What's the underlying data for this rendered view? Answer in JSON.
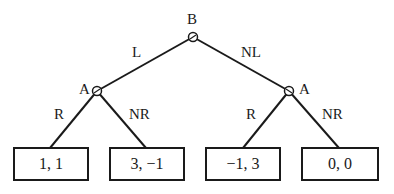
{
  "diagram": {
    "type": "game-tree",
    "root": {
      "player": "B",
      "actions": [
        {
          "label": "L",
          "node": {
            "player": "A",
            "actions": [
              {
                "label": "R",
                "payoff": "1, 1"
              },
              {
                "label": "NR",
                "payoff": "3, −1"
              }
            ]
          }
        },
        {
          "label": "NL",
          "node": {
            "player": "A",
            "actions": [
              {
                "label": "R",
                "payoff": "−1, 3"
              },
              {
                "label": "NR",
                "payoff": "0, 0"
              }
            ]
          }
        }
      ]
    }
  },
  "labels": {
    "root_player": "B",
    "left_player": "A",
    "right_player": "A",
    "edge_L": "L",
    "edge_NL": "NL",
    "edge_left_R": "R",
    "edge_left_NR": "NR",
    "edge_right_R": "R",
    "edge_right_NR": "NR"
  },
  "payoffs": [
    "1, 1",
    "3, −1",
    "−1, 3",
    "0, 0"
  ]
}
